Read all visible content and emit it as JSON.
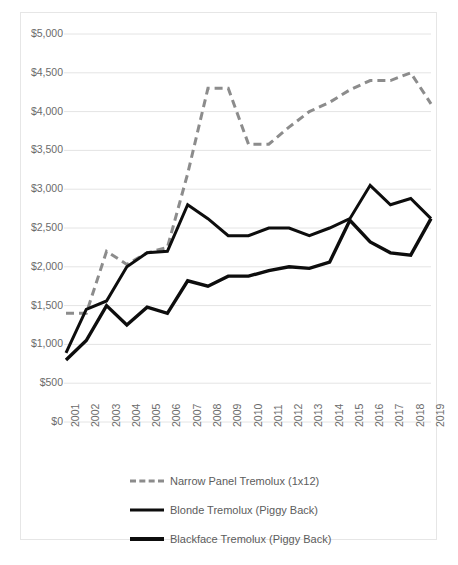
{
  "chart_data": {
    "type": "line",
    "title": "",
    "xlabel": "",
    "ylabel": "",
    "grid": true,
    "legend_position": "bottom",
    "ylim": [
      0,
      5000
    ],
    "ytick_step": 500,
    "ytick_labels": [
      "$5,000",
      "$4,500",
      "$4,000",
      "$3,500",
      "$3,000",
      "$2,500",
      "$2,000",
      "$1,500",
      "$1,000",
      "$500",
      "$0"
    ],
    "ytick_values": [
      5000,
      4500,
      4000,
      3500,
      3000,
      2500,
      2000,
      1500,
      1000,
      500,
      0
    ],
    "categories": [
      "2001",
      "2002",
      "2003",
      "2004",
      "2005",
      "2006",
      "2007",
      "2008",
      "2009",
      "2010",
      "2011",
      "2012",
      "2013",
      "2014",
      "2015",
      "2016",
      "2017",
      "2018",
      "2019"
    ],
    "x": [
      2001,
      2002,
      2003,
      2004,
      2005,
      2006,
      2007,
      2008,
      2009,
      2010,
      2011,
      2012,
      2013,
      2014,
      2015,
      2016,
      2017,
      2018,
      2019
    ],
    "series": [
      {
        "name": "Narrow Panel Tremolux (1x12)",
        "style": "dashed",
        "color": "#8c8c8c",
        "width": 3,
        "values": [
          1400,
          1400,
          2200,
          2030,
          2180,
          2250,
          3200,
          4300,
          4300,
          3580,
          3580,
          3800,
          4000,
          4120,
          4280,
          4400,
          4400,
          4500,
          4100
        ]
      },
      {
        "name": "Blonde Tremolux (Piggy Back)",
        "style": "solid",
        "color": "#0d0d0d",
        "width": 3,
        "values": [
          890,
          1450,
          1560,
          2000,
          2180,
          2200,
          2800,
          2620,
          2400,
          2400,
          2500,
          2500,
          2400,
          2500,
          2620,
          3050,
          2800,
          2880,
          2620
        ]
      },
      {
        "name": "Blackface Tremolux (Piggy Back)",
        "style": "solid",
        "color": "#0d0d0d",
        "width": 3.4,
        "values": [
          800,
          1050,
          1500,
          1250,
          1480,
          1400,
          1820,
          1750,
          1880,
          1880,
          1950,
          2000,
          1980,
          2060,
          2600,
          2320,
          2180,
          2150,
          2620
        ]
      }
    ]
  },
  "legend": {
    "items": [
      {
        "label": "Narrow Panel Tremolux (1x12)",
        "style": "dashed"
      },
      {
        "label": "Blonde Tremolux (Piggy Back)",
        "style": "solid-thin"
      },
      {
        "label": "Blackface Tremolux (Piggy Back)",
        "style": "solid-thick"
      }
    ]
  }
}
